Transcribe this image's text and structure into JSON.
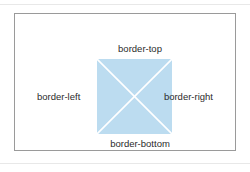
{
  "diagram": {
    "frame": {
      "border_color": "#9a9a9a",
      "background_color": "#ffffff"
    },
    "content_box": {
      "fill_color": "#bcdcf0",
      "diagonal_color": "#ffffff",
      "width_px": 75,
      "height_px": 75
    },
    "labels": {
      "top": "border-top",
      "right": "border-right",
      "bottom": "border-bottom",
      "left": "border-left"
    },
    "text_color": "#2b2b2b",
    "page_rule_color": "#e8e8e8"
  }
}
